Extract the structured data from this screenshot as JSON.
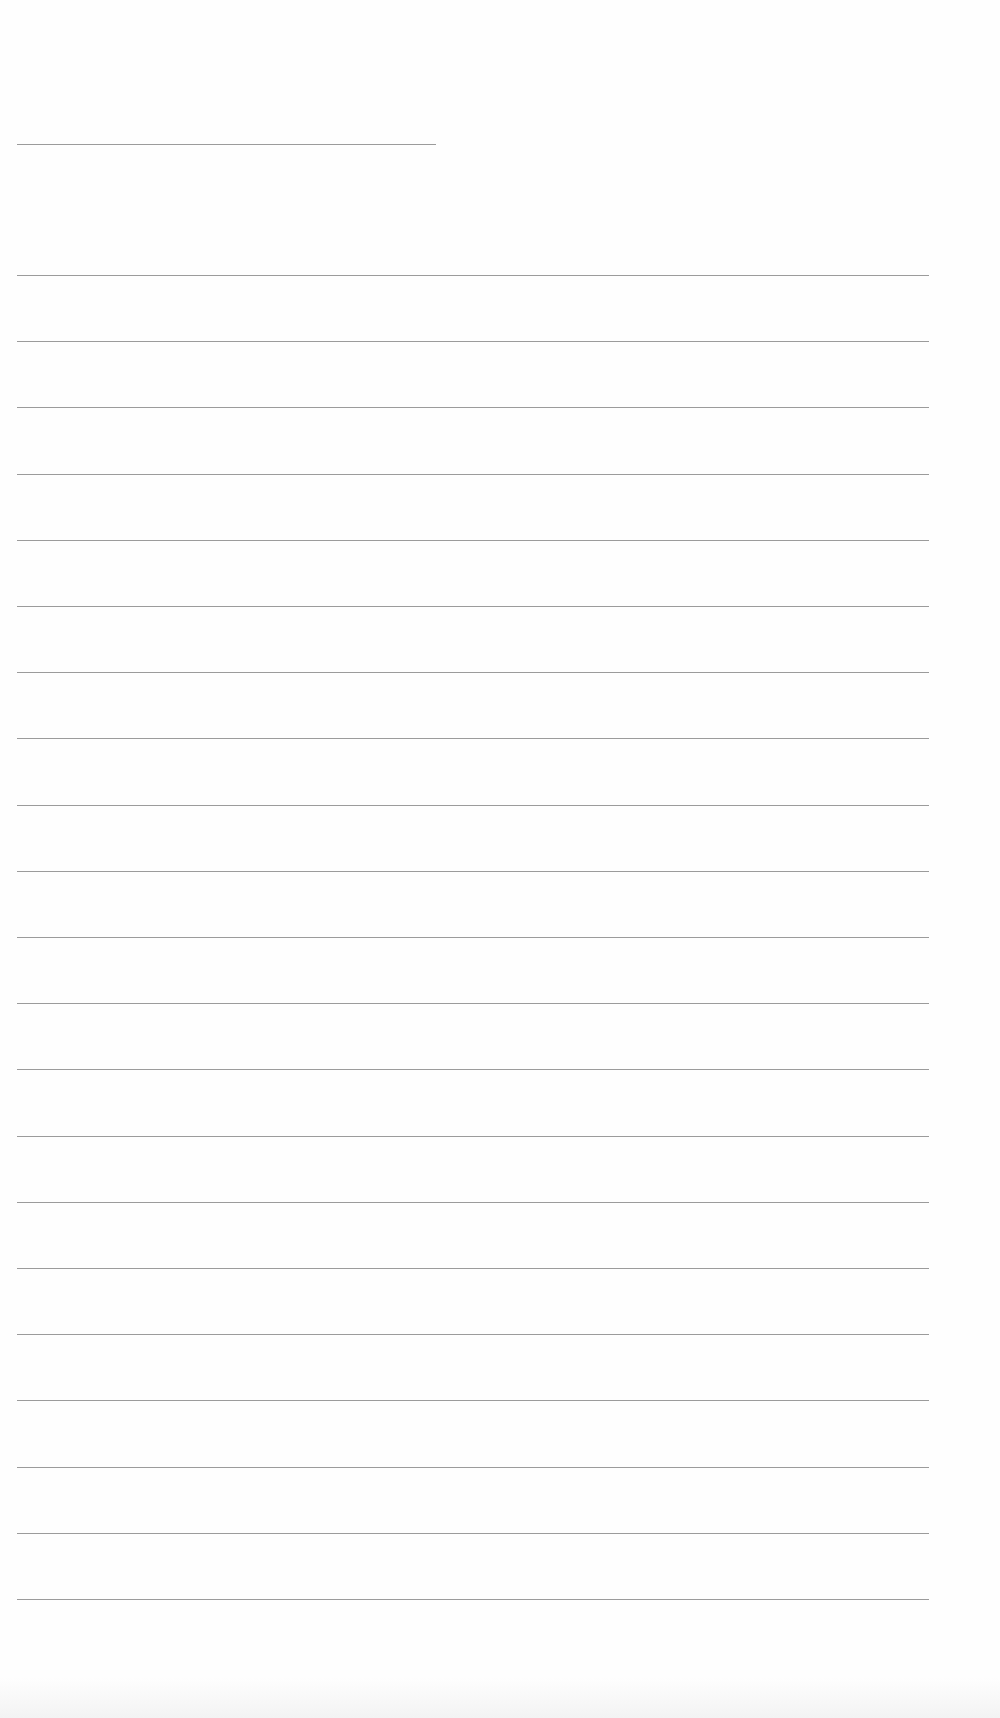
{
  "page": {
    "type": "blank lined sheet",
    "background": "#fefefe",
    "line_color": "#8a8a8a"
  },
  "header_line": {
    "x": 17,
    "y": 144,
    "width": 419
  },
  "rules": {
    "x": 17,
    "width": 912,
    "start_y": 275,
    "spacing": 66.2,
    "count": 22
  }
}
